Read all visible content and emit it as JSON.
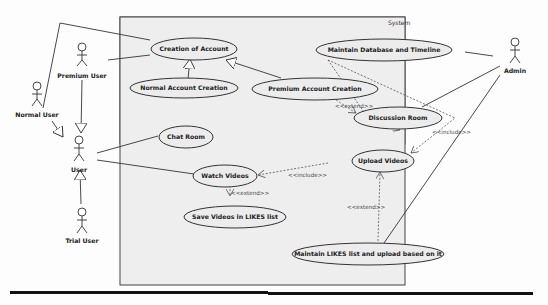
{
  "system": {
    "label": "System"
  },
  "actors": [
    {
      "id": "normal_user",
      "label": "Normal User"
    },
    {
      "id": "premium_user",
      "label": "Premium User"
    },
    {
      "id": "user",
      "label": "User"
    },
    {
      "id": "trial_user",
      "label": "Trial User"
    },
    {
      "id": "admin",
      "label": "Admin"
    }
  ],
  "use_cases": [
    {
      "id": "creation_account",
      "label": "Creation of Account"
    },
    {
      "id": "normal_account",
      "label": "Normal Account Creation"
    },
    {
      "id": "premium_account",
      "label": "Premium Account Creation"
    },
    {
      "id": "maintain_db",
      "label": "Maintain Database and Timeline"
    },
    {
      "id": "discussion_room",
      "label": "Discussion Room"
    },
    {
      "id": "chat_room",
      "label": "Chat Room"
    },
    {
      "id": "upload_videos",
      "label": "Upload Videos"
    },
    {
      "id": "watch_videos",
      "label": "Watch Videos"
    },
    {
      "id": "save_videos",
      "label": "Save Videos in LIKES list"
    },
    {
      "id": "maintain_likes",
      "label": "Maintain LIKES list and upload based on it"
    }
  ],
  "relations": {
    "extend_premium_discussion": "<<extend>>",
    "include_db_upload": "<<include>>",
    "include_watch_upload": "<<include>>",
    "extend_save_watch": "<<extend>>",
    "extend_likes_upload": "<<extend>>"
  }
}
